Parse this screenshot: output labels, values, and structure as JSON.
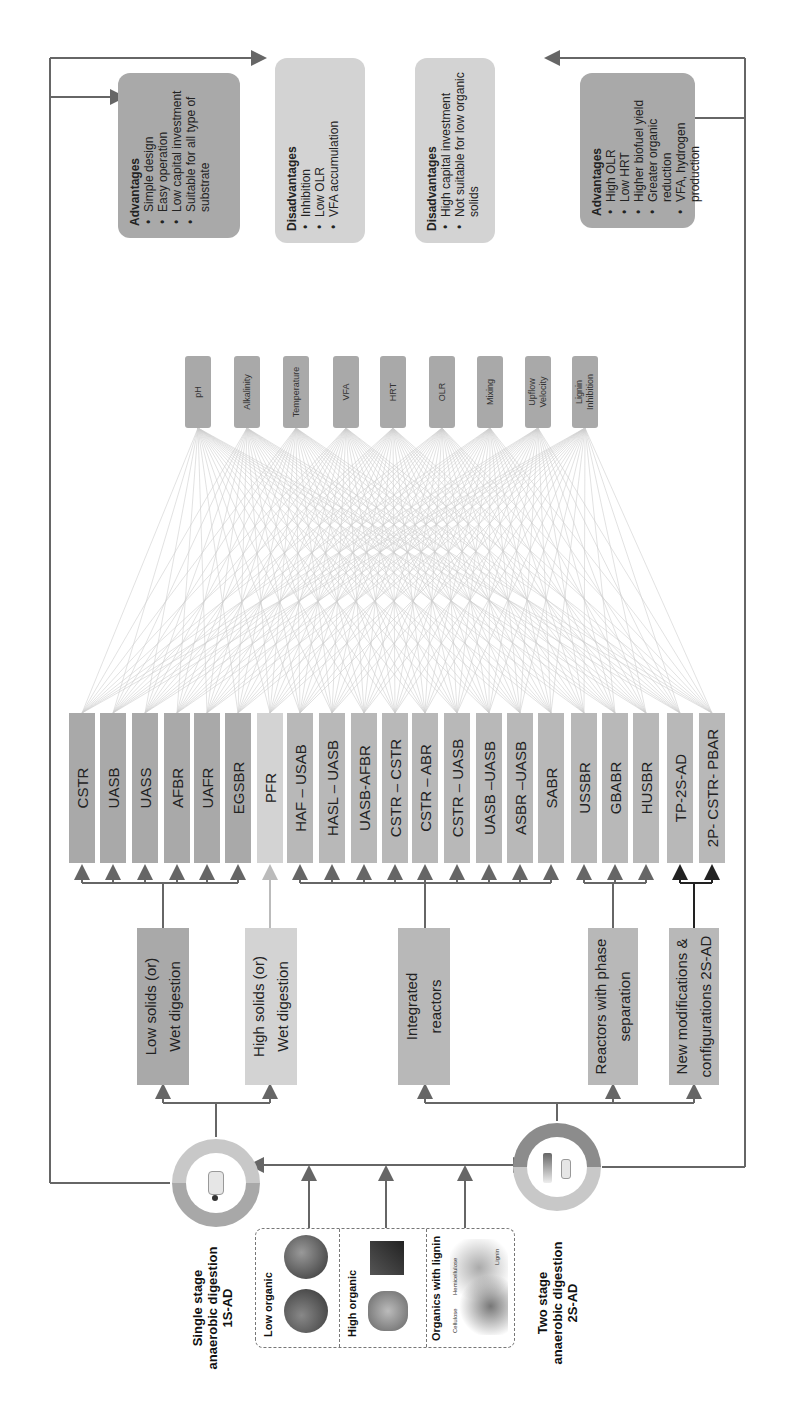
{
  "stages": {
    "single": {
      "title": "Single stage\nanaerobic digestion\n1S-AD"
    },
    "two": {
      "title": "Two stage\nanaerobic digestion\n2S-AD"
    }
  },
  "feedstock": [
    {
      "label": "Low organic"
    },
    {
      "label": "High organic"
    },
    {
      "label": "Organics with lignin",
      "sublabels": [
        "Cellulose",
        "Hemicellulose",
        "Lignin"
      ]
    }
  ],
  "categories": [
    {
      "label": "Low solids (or)\nWet digestion",
      "shade": "dark"
    },
    {
      "label": "High solids (or)\nWet digestion",
      "shade": "light"
    },
    {
      "label": "Integrated\nreactors",
      "shade": "mid"
    },
    {
      "label": "Reactors with phase\nseparation",
      "shade": "mid"
    },
    {
      "label": "New modifications &\nconfigurations 2S-AD",
      "shade": "mid"
    }
  ],
  "reactors": [
    "CSTR",
    "UASB",
    "UASS",
    "AFBR",
    "UAFR",
    "EGSBR",
    "PFR",
    "HAF – USAB",
    "HASL – UASB",
    "UASB-AFBR",
    "CSTR – CSTR",
    "CSTR – ABR",
    "CSTR – UASB",
    "UASB –UASB",
    "ASBR –UASB",
    "SABR",
    "USSBR",
    "GBABR",
    "HUSBR",
    "TP-2S-AD",
    "2P- CSTR- PBAR"
  ],
  "parameters": [
    "pH",
    "Alkalinity",
    "Temperature",
    "VFA",
    "HRT",
    "OLR",
    "Mixing",
    "Upflow\nVelocity",
    "Lignin\nInhibition"
  ],
  "notes": {
    "single_advantages": {
      "heading": "Advantages",
      "items": [
        "Simple design",
        "Easy operation",
        "Low capital investment",
        "Suitable for all type of substrate"
      ]
    },
    "single_disadvantages": {
      "heading": "Disadvantages",
      "items": [
        "Inhibition",
        "Low OLR",
        "VFA accumulation"
      ]
    },
    "two_disadvantages": {
      "heading": "Disadvantages",
      "items": [
        "High capital investment",
        "Not suitable for low organic solids"
      ]
    },
    "two_advantages": {
      "heading": "Advantages",
      "items": [
        "High OLR",
        "Low HRT",
        "Higher biofuel yield",
        "Greater organic reduction",
        "VFA, hydrogen production"
      ]
    }
  },
  "colors": {
    "dark": "#a9a9a9",
    "mid": "#b8b8b8",
    "light": "#d3d3d3",
    "line": "#666666",
    "mesh": "#cfcfcf"
  }
}
